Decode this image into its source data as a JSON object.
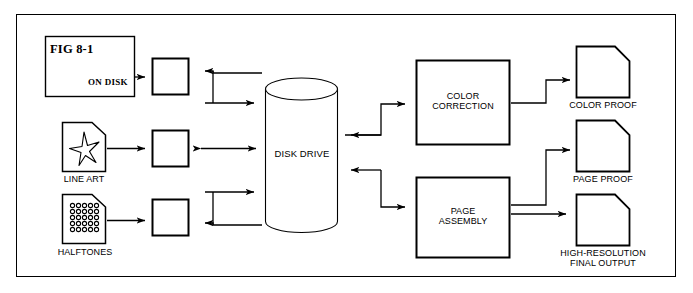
{
  "diagram": {
    "title_box": {
      "figure_label": "FIG 8-1",
      "status_label": "ON DISK"
    },
    "inputs": [
      {
        "id": "on-disk",
        "label": "",
        "icon": "page-icon"
      },
      {
        "id": "line-art",
        "label": "LINE ART",
        "icon": "star-document-icon"
      },
      {
        "id": "halftones",
        "label": "HALFTONES",
        "icon": "halftone-dots-document-icon"
      }
    ],
    "scanner_boxes": [
      {
        "id": "scanner-1",
        "label": ""
      },
      {
        "id": "scanner-2",
        "label": ""
      },
      {
        "id": "scanner-3",
        "label": ""
      }
    ],
    "storage": {
      "label": "DISK DRIVE",
      "icon": "cylinder-icon"
    },
    "processes": [
      {
        "id": "color-correction",
        "line1": "COLOR",
        "line2": "CORRECTION"
      },
      {
        "id": "page-assembly",
        "line1": "PAGE",
        "line2": "ASSEMBLY"
      }
    ],
    "outputs": [
      {
        "id": "color-proof",
        "line1": "COLOR PROOF",
        "line2": "",
        "icon": "document-icon"
      },
      {
        "id": "page-proof",
        "line1": "PAGE PROOF",
        "line2": "",
        "icon": "document-icon"
      },
      {
        "id": "final-output",
        "line1": "HIGH-RESOLUTION",
        "line2": "FINAL OUTPUT",
        "icon": "document-icon"
      }
    ],
    "colors": {
      "stroke": "#000000",
      "background": "#ffffff",
      "thin_stroke": "#1a1a1a"
    }
  }
}
